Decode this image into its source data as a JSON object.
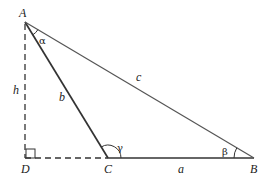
{
  "diagram": {
    "vertices": [
      {
        "id": "A",
        "label": "A"
      },
      {
        "id": "B",
        "label": "B"
      },
      {
        "id": "C",
        "label": "C"
      },
      {
        "id": "D",
        "label": "D"
      }
    ],
    "sides": [
      {
        "id": "a",
        "label": "a",
        "between": [
          "C",
          "B"
        ],
        "style": "solid"
      },
      {
        "id": "b",
        "label": "b",
        "between": [
          "A",
          "C"
        ],
        "style": "solid"
      },
      {
        "id": "c",
        "label": "c",
        "between": [
          "A",
          "B"
        ],
        "style": "solid"
      },
      {
        "id": "h",
        "label": "h",
        "between": [
          "A",
          "D"
        ],
        "style": "dashed"
      },
      {
        "id": "dc",
        "label": "",
        "between": [
          "D",
          "C"
        ],
        "style": "dashed"
      }
    ],
    "angles": [
      {
        "id": "alpha",
        "label": "α",
        "at": "A"
      },
      {
        "id": "beta",
        "label": "β",
        "at": "B"
      },
      {
        "id": "gamma",
        "label": "γ",
        "at": "C"
      }
    ],
    "right_angle_marker_at": "D",
    "colors": {
      "line": "#333333",
      "text": "#222222"
    }
  }
}
